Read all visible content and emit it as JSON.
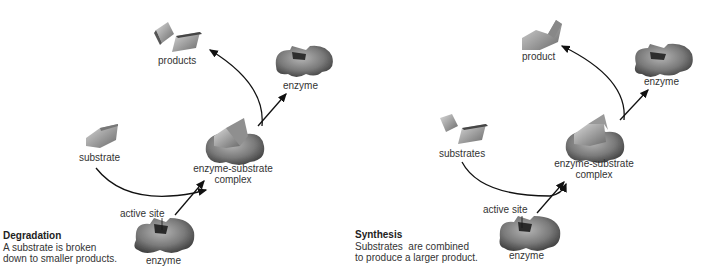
{
  "panels": [
    {
      "id": "degradation",
      "title": "Degradation",
      "description_lines": [
        "A substrate is broken",
        "down to smaller products."
      ],
      "labels": {
        "products": "products",
        "enzyme_released": "enzyme",
        "substrate": "substrate",
        "complex_line1": "enzyme-substrate",
        "complex_line2": "complex",
        "active_site": "active site",
        "enzyme": "enzyme"
      }
    },
    {
      "id": "synthesis",
      "title": "Synthesis",
      "description_lines": [
        "Substrates  are combined",
        "to produce a larger product."
      ],
      "labels": {
        "products": "product",
        "enzyme_released": "enzyme",
        "substrate": "substrates",
        "complex_line1": "enzyme-substrate",
        "complex_line2": "complex",
        "active_site": "active site",
        "enzyme": "enzyme"
      }
    }
  ],
  "colors": {
    "background": "#ffffff",
    "shape_dark": "#5a5a5a",
    "shape_mid": "#8a8a8a",
    "shape_light": "#c8c8c8",
    "arrow": "#111111",
    "text": "#333333"
  }
}
